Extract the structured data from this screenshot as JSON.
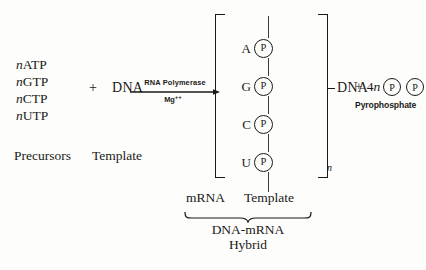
{
  "diagram": {
    "background_color": "#fdfdfb",
    "ink_color": "#1a1a18"
  },
  "precursors": {
    "items": [
      {
        "coefficient": "n",
        "molecule": "ATP"
      },
      {
        "coefficient": "n",
        "molecule": "GTP"
      },
      {
        "coefficient": "n",
        "molecule": "CTP"
      },
      {
        "coefficient": "n",
        "molecule": "UTP"
      }
    ],
    "label": "Precursors"
  },
  "operators": {
    "plus_1": "+",
    "plus_2": "+"
  },
  "template": {
    "molecule": "DNA",
    "label": "Template"
  },
  "arrow": {
    "enzyme": "RNA Polymerase",
    "cofactor": "Mg",
    "cofactor_charge": "++"
  },
  "hybrid": {
    "bases": [
      {
        "base": "A",
        "group": "P"
      },
      {
        "base": "G",
        "group": "P"
      },
      {
        "base": "C",
        "group": "P"
      },
      {
        "base": "U",
        "group": "P"
      }
    ],
    "subscript": "n",
    "strand_label": "DNA",
    "left_label": "mRNA",
    "right_label": "Template",
    "caption_line1": "DNA-mRNA",
    "caption_line2": "Hybrid"
  },
  "pyrophosphate": {
    "coefficient_number": "4",
    "coefficient_variable": "n",
    "group_1": "P",
    "group_2": "P",
    "label": "Pyrophosphate"
  }
}
